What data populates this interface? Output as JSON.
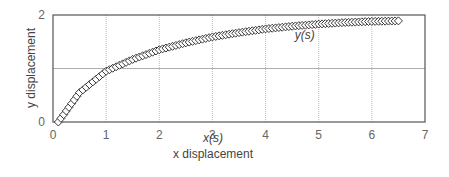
{
  "chart_data": {
    "type": "scatter",
    "title": "",
    "xlabel": "x displacement",
    "xlabel_sub": "x(s)",
    "ylabel": "y displacement",
    "xlim": [
      0,
      7
    ],
    "ylim": [
      0,
      2
    ],
    "x_ticks": [
      "0",
      "1",
      "2",
      "3",
      "4",
      "5",
      "6",
      "7"
    ],
    "y_ticks": [
      "0",
      "2"
    ],
    "grid": true,
    "legend": null,
    "annotations": [
      {
        "text": "y(s)",
        "x": 4.55,
        "y": 1.55
      }
    ],
    "series": [
      {
        "name": "y(s)",
        "marker": "diamond-open",
        "line": "solid-black",
        "points": [
          [
            0.1,
            0.0
          ],
          [
            0.5,
            0.55
          ],
          [
            1.0,
            0.95
          ],
          [
            1.5,
            1.17
          ],
          [
            2.0,
            1.35
          ],
          [
            2.5,
            1.48
          ],
          [
            3.0,
            1.59
          ],
          [
            3.5,
            1.67
          ],
          [
            4.0,
            1.74
          ],
          [
            4.5,
            1.79
          ],
          [
            5.0,
            1.83
          ],
          [
            5.5,
            1.86
          ],
          [
            6.0,
            1.88
          ],
          [
            6.5,
            1.89
          ]
        ]
      }
    ]
  }
}
